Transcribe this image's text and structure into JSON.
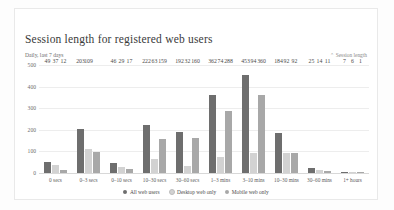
{
  "card": {
    "title": "Session length for registered web users",
    "subtitle": "Daily, last 7 days",
    "corner_label": "Session length",
    "corner_icon": "chevron-down-icon"
  },
  "colors": {
    "all_web_users": "#6e6e6e",
    "desktop_web_only": "#d2d2d2",
    "mobile_web_only": "#a8a8a8",
    "gridline": "#ededed",
    "card_border": "#e9e9e9"
  },
  "chart_data": {
    "type": "bar",
    "title": "Session length for registered web users",
    "subtitle": "Daily, last 7 days",
    "xlabel": "",
    "ylabel": "",
    "ylim": [
      0,
      500
    ],
    "yticks": [
      0,
      100,
      200,
      300,
      400,
      500
    ],
    "grid": true,
    "legend_position": "bottom",
    "categories": [
      "0 secs",
      "0–3 secs",
      "0–10 secs",
      "10–30 secs",
      "30–60 secs",
      "1–3 mins",
      "3–10 mins",
      "10–30 mins",
      "30–60 mins",
      "1+ hours"
    ],
    "series": [
      {
        "name": "All web users",
        "color": "#6e6e6e",
        "values": [
          49,
          203,
          46,
          222,
          192,
          362,
          453,
          184,
          25,
          7
        ]
      },
      {
        "name": "Desktop web only",
        "color": "#d2d2d2",
        "values": [
          37,
          109,
          29,
          63,
          32,
          74,
          94,
          92,
          14,
          6
        ]
      },
      {
        "name": "Mobile web only",
        "color": "#a8a8a8",
        "values": [
          12,
          97,
          17,
          159,
          160,
          288,
          360,
          92,
          11,
          1
        ]
      }
    ],
    "value_labels": [
      [
        "49",
        "37",
        "12"
      ],
      [
        "203",
        "109",
        ""
      ],
      [
        "46",
        "29",
        "17"
      ],
      [
        "222",
        "63",
        "159"
      ],
      [
        "192",
        "32",
        "160"
      ],
      [
        "362",
        "74",
        "288"
      ],
      [
        "453",
        "94",
        "360"
      ],
      [
        "184",
        "92",
        "92"
      ],
      [
        "25",
        "14",
        "11"
      ],
      [
        "7",
        "6",
        "1"
      ]
    ]
  }
}
